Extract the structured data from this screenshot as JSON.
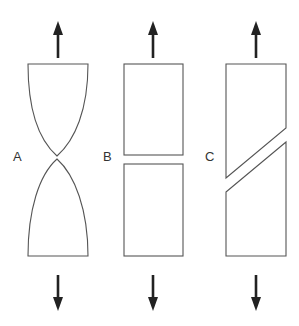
{
  "diagram": {
    "panels": [
      {
        "label": "A",
        "type": "necked-ductile-fracture"
      },
      {
        "label": "B",
        "type": "flat-brittle-fracture"
      },
      {
        "label": "C",
        "type": "shear-slanted-fracture"
      }
    ],
    "arrows": {
      "top": "up",
      "bottom": "down"
    },
    "colors": {
      "outline": "#555555",
      "arrow": "#222222",
      "background": "#ffffff"
    }
  }
}
